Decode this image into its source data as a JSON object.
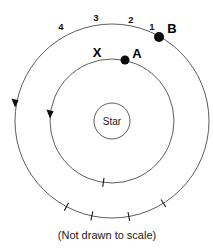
{
  "figure": {
    "caption": "(Not drawn to scale)",
    "star": {
      "label": "Star",
      "center_x": 112,
      "center_y": 121,
      "radius": 18
    },
    "orbits": [
      {
        "name": "inner-orbit",
        "center_x": 112,
        "center_y": 121,
        "radius": 62,
        "direction_arrow": "counterclockwise-downward-on-left"
      },
      {
        "name": "outer-orbit",
        "center_x": 112,
        "center_y": 121,
        "radius": 97,
        "direction_arrow": "counterclockwise-downward-on-left"
      }
    ],
    "ticks": [
      {
        "label": "4",
        "orbit": "outer-orbit",
        "angle_deg": 148,
        "label_x": 61,
        "label_y": 30
      },
      {
        "label": "3",
        "orbit": "outer-orbit",
        "angle_deg": 170,
        "label_x": 96,
        "label_y": 21
      },
      {
        "label": "2",
        "orbit": "outer-orbit",
        "angle_deg": 192,
        "label_x": 131,
        "label_y": 23
      },
      {
        "label": "1",
        "orbit": "outer-orbit",
        "angle_deg": 208,
        "label_x": 152,
        "label_y": 30
      },
      {
        "label": "X",
        "orbit": "inner-orbit",
        "angle_deg": 188,
        "label_x": 97,
        "label_y": 57
      }
    ],
    "bodies": [
      {
        "label": "B",
        "orbit": "outer-orbit",
        "dot_x": 159,
        "dot_y": 37,
        "label_x": 172,
        "label_y": 33,
        "radius": 5
      },
      {
        "label": "A",
        "orbit": "inner-orbit",
        "dot_x": 125,
        "dot_y": 60,
        "label_x": 137,
        "label_y": 58,
        "radius": 4.5
      }
    ],
    "arrows": [
      {
        "name": "outer-orbit-direction-arrow",
        "x": 15,
        "y": 103
      },
      {
        "name": "inner-orbit-direction-arrow",
        "x": 50,
        "y": 114
      }
    ],
    "colors": {
      "background": "#ffffff",
      "orbit_stroke": "#4a4a4a",
      "marker_fill": "#0a0a0a",
      "text": "#111111"
    }
  }
}
